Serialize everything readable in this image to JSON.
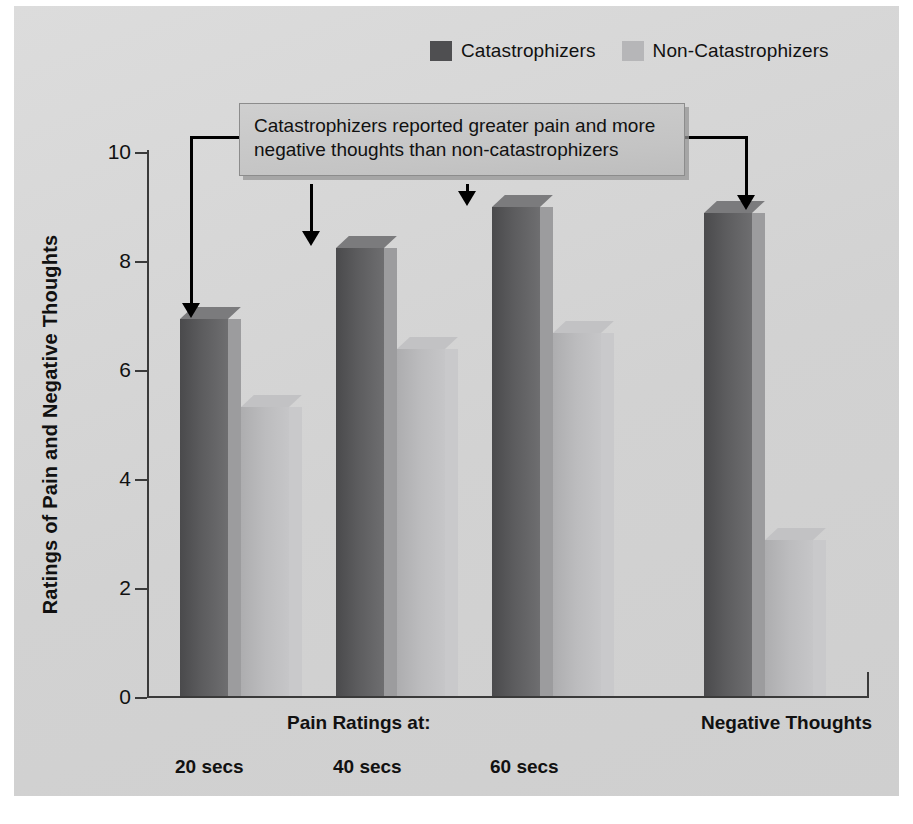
{
  "chart_data": {
    "type": "bar",
    "title": "",
    "xlabel": "",
    "ylabel": "Ratings of Pain and Negative Thoughts",
    "ylim": [
      0,
      10
    ],
    "yticks": [
      0,
      2,
      4,
      6,
      8,
      10
    ],
    "grid": false,
    "legend_position": "top",
    "categories": [
      "20 secs",
      "40 secs",
      "60 secs",
      "Negative Thoughts"
    ],
    "group_headers": [
      "Pain Ratings at:",
      "Negative Thoughts"
    ],
    "series": [
      {
        "name": "Catastrophizers",
        "color": "#58585a",
        "values": [
          6.9,
          8.2,
          8.95,
          8.85
        ]
      },
      {
        "name": "Non-Catastrophizers",
        "color": "#b8b8ba",
        "values": [
          5.3,
          6.35,
          6.65,
          2.85
        ]
      }
    ],
    "annotations": [
      {
        "text_line_1": "Catastrophizers reported greater pain and more",
        "text_line_2": "negative thoughts than non-catastrophizers",
        "points_to": [
          "20 secs Catastrophizers",
          "40 secs Catastrophizers",
          "60 secs Catastrophizers",
          "Negative Thoughts Catastrophizers"
        ]
      }
    ]
  },
  "legend": {
    "items": [
      {
        "label": "Catastrophizers",
        "color": "#4f4f51"
      },
      {
        "label": "Non-Catastrophizers",
        "color": "#b6b6b8"
      }
    ]
  },
  "axis": {
    "y_title": "Ratings of Pain and Negative Thoughts",
    "y_labels": [
      "10",
      "8",
      "6",
      "4",
      "2",
      "0"
    ]
  },
  "x_labels": {
    "group_title": "Pain Ratings at:",
    "negative_thoughts": "Negative Thoughts",
    "ticks": [
      "20 secs",
      "40 secs",
      "60 secs"
    ]
  },
  "callout": {
    "line1": "Catastrophizers reported greater pain and more",
    "line2": "negative thoughts than non-catastrophizers"
  },
  "caption": {
    "text": ""
  }
}
